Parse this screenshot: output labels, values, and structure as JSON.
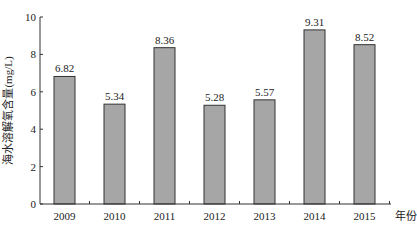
{
  "chart_data": {
    "type": "bar",
    "title": "",
    "xlabel": "年份",
    "ylabel": "海水溶解氧含量(mg/L)",
    "categories": [
      "2009",
      "2010",
      "2011",
      "2012",
      "2013",
      "2014",
      "2015"
    ],
    "values": [
      6.82,
      5.34,
      8.36,
      5.28,
      5.57,
      9.31,
      8.52
    ],
    "data_labels": [
      "6.82",
      "5.34",
      "8.36",
      "5.28",
      "5.57",
      "9.31",
      "8.52"
    ],
    "ylim": [
      0,
      10
    ],
    "yticks": [
      0,
      2,
      4,
      6,
      8,
      10
    ],
    "ytick_labels": [
      "0",
      "2",
      "4",
      "6",
      "8",
      "10"
    ],
    "grid": false,
    "legend": "none",
    "bar_color": "#a6a6a6",
    "bar_edge_color": "#333333"
  }
}
